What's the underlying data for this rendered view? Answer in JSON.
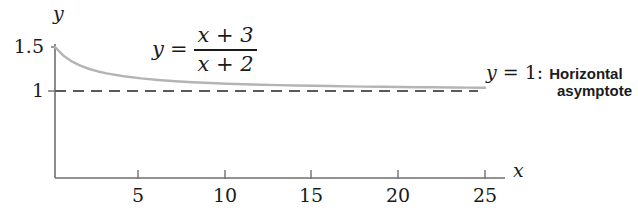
{
  "chart_data": {
    "type": "line",
    "title": "",
    "xlabel": "x",
    "ylabel": "y",
    "xlim": [
      0,
      26.5
    ],
    "ylim": [
      0,
      1.72
    ],
    "grid": false,
    "legend_position": "none",
    "xticks": [
      5,
      10,
      15,
      20,
      25
    ],
    "xticklabels": [
      "5",
      "10",
      "15",
      "20",
      "25"
    ],
    "yticks": [
      1,
      1.5
    ],
    "yticklabels": [
      "1",
      "1.5"
    ],
    "series": [
      {
        "name": "y = (x + 3) / (x + 2)",
        "style": "solid",
        "color": "#b4b4b4",
        "x": [
          0,
          0.5,
          1,
          1.5,
          2,
          2.5,
          3,
          4,
          5,
          6,
          7,
          8,
          9,
          10,
          11,
          12,
          13,
          14,
          15,
          16,
          17,
          18,
          19,
          20,
          21,
          22,
          23,
          24,
          25
        ],
        "y": [
          1.5,
          1.4,
          1.333,
          1.286,
          1.25,
          1.222,
          1.2,
          1.167,
          1.143,
          1.125,
          1.111,
          1.1,
          1.091,
          1.083,
          1.077,
          1.071,
          1.067,
          1.063,
          1.059,
          1.056,
          1.053,
          1.05,
          1.048,
          1.045,
          1.043,
          1.042,
          1.04,
          1.038,
          1.037
        ]
      },
      {
        "name": "y = 1",
        "style": "dashed",
        "color": "#5a5a5a",
        "x": [
          0,
          25.5
        ],
        "y": [
          1,
          1
        ]
      }
    ],
    "annotations": [
      {
        "name": "curve-equation",
        "text": "y = (x + 3)/(x + 2)",
        "at_x": 6.5,
        "at_y": 1.55
      },
      {
        "name": "asymptote-label",
        "text": "y = 1: Horizontal asymptote",
        "at_x": 25.5,
        "at_y": 1.0
      }
    ]
  },
  "axes": {
    "y_axis_label": "y",
    "x_axis_label": "x",
    "y_tick_top": "1.5",
    "y_tick_one": "1"
  },
  "xticklabels": {
    "t5": "5",
    "t10": "10",
    "t15": "15",
    "t20": "20",
    "t25": "25"
  },
  "equation": {
    "lhs": "y",
    "equals": "=",
    "numerator": "x + 3",
    "denominator": "x + 2"
  },
  "asymptote_note": {
    "math_y": "y",
    "equals": "=",
    "value": "1",
    "colon_space": ": ",
    "line1_text": "Horizontal",
    "line2_text": "asymptote"
  },
  "colors": {
    "background": "#ffffff",
    "axis": "#6f6f6f",
    "curve": "#b4b4b4",
    "asymptote": "#5a5a5a",
    "text": "#1b1b1b"
  }
}
